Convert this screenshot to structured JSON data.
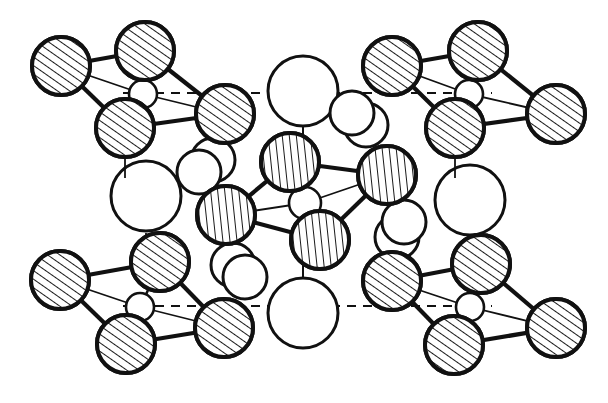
{
  "figure": {
    "caption": "",
    "background_color": "#ffffff",
    "stroke_color": "#111111",
    "hatch_color": "#1a1a1a",
    "fill_color": "#ffffff",
    "width": 608,
    "height": 403
  },
  "legend": {
    "atom_types": [
      {
        "name": "tetrahedral-anion-corner",
        "style": "hatched-diagonal",
        "radius": 27
      },
      {
        "name": "tetrahedral-anion-center",
        "style": "hatched-vertical",
        "radius": 27
      },
      {
        "name": "tetrahedral-cation-core",
        "style": "open-small",
        "radius": 14
      },
      {
        "name": "large-cation",
        "style": "open-large",
        "radius": 35
      },
      {
        "name": "paired-cation",
        "style": "open-medium",
        "radius": 22
      }
    ]
  },
  "guide_lines": [
    {
      "name": "upper-cell-axis",
      "x1": 123,
      "y1": 93,
      "x2": 492,
      "y2": 93,
      "dash": "9,7"
    },
    {
      "name": "lower-cell-axis",
      "x1": 123,
      "y1": 306,
      "x2": 492,
      "y2": 306,
      "dash": "9,7"
    }
  ],
  "tetrahedra": [
    {
      "name": "tetrahedron-top-left",
      "hatch": "diagonal",
      "core": {
        "cx": 143,
        "cy": 94,
        "r": 14
      },
      "vertices": [
        {
          "name": "vertex-left",
          "cx": 61,
          "cy": 66,
          "r": 29
        },
        {
          "name": "vertex-top",
          "cx": 145,
          "cy": 51,
          "r": 29
        },
        {
          "name": "vertex-right",
          "cx": 225,
          "cy": 114,
          "r": 29
        },
        {
          "name": "vertex-bottom",
          "cx": 125,
          "cy": 128,
          "r": 29
        }
      ],
      "thin_bonds": [
        [
          0,
          3
        ],
        [
          1,
          3
        ],
        [
          2,
          3
        ]
      ],
      "stub": {
        "x1": 125,
        "y1": 157,
        "x2": 125,
        "y2": 178
      }
    },
    {
      "name": "tetrahedron-top-right",
      "hatch": "diagonal",
      "core": {
        "cx": 469,
        "cy": 94,
        "r": 14
      },
      "vertices": [
        {
          "name": "vertex-left",
          "cx": 392,
          "cy": 66,
          "r": 29
        },
        {
          "name": "vertex-top",
          "cx": 478,
          "cy": 51,
          "r": 29
        },
        {
          "name": "vertex-right",
          "cx": 556,
          "cy": 114,
          "r": 29
        },
        {
          "name": "vertex-bottom",
          "cx": 455,
          "cy": 128,
          "r": 29
        }
      ],
      "thin_bonds": [
        [
          0,
          3
        ],
        [
          1,
          3
        ],
        [
          2,
          3
        ]
      ],
      "stub": {
        "x1": 455,
        "y1": 157,
        "x2": 455,
        "y2": 178
      }
    },
    {
      "name": "tetrahedron-bottom-left",
      "hatch": "diagonal",
      "core": {
        "cx": 140,
        "cy": 307,
        "r": 14
      },
      "vertices": [
        {
          "name": "vertex-left",
          "cx": 60,
          "cy": 280,
          "r": 29
        },
        {
          "name": "vertex-top",
          "cx": 160,
          "cy": 262,
          "r": 29
        },
        {
          "name": "vertex-right",
          "cx": 224,
          "cy": 328,
          "r": 29
        },
        {
          "name": "vertex-bottom",
          "cx": 126,
          "cy": 344,
          "r": 29
        }
      ],
      "thin_bonds": [
        [
          0,
          3
        ],
        [
          1,
          3
        ],
        [
          2,
          3
        ]
      ],
      "stub": {
        "x1": 146,
        "y1": 233,
        "x2": 146,
        "y2": 262
      }
    },
    {
      "name": "tetrahedron-bottom-right",
      "hatch": "diagonal",
      "core": {
        "cx": 470,
        "cy": 307,
        "r": 14
      },
      "vertices": [
        {
          "name": "vertex-left",
          "cx": 392,
          "cy": 281,
          "r": 29
        },
        {
          "name": "vertex-top",
          "cx": 481,
          "cy": 264,
          "r": 29
        },
        {
          "name": "vertex-right",
          "cx": 556,
          "cy": 328,
          "r": 29
        },
        {
          "name": "vertex-bottom",
          "cx": 454,
          "cy": 345,
          "r": 29
        }
      ],
      "thin_bonds": [
        [
          0,
          3
        ],
        [
          1,
          3
        ],
        [
          2,
          3
        ]
      ],
      "stub": {
        "x1": 472,
        "y1": 238,
        "x2": 472,
        "y2": 264
      }
    },
    {
      "name": "tetrahedron-center",
      "hatch": "vertical",
      "core": {
        "cx": 305,
        "cy": 203,
        "r": 16
      },
      "vertices": [
        {
          "name": "vertex-left",
          "cx": 226,
          "cy": 215,
          "r": 29
        },
        {
          "name": "vertex-top",
          "cx": 290,
          "cy": 162,
          "r": 29
        },
        {
          "name": "vertex-right",
          "cx": 387,
          "cy": 175,
          "r": 29
        },
        {
          "name": "vertex-bottom",
          "cx": 320,
          "cy": 240,
          "r": 29
        }
      ],
      "thin_bonds": [
        [
          0,
          3
        ],
        [
          1,
          3
        ],
        [
          2,
          3
        ]
      ],
      "stub": {
        "x1": 305,
        "y1": 187,
        "x2": 305,
        "y2": 173
      }
    }
  ],
  "large_cations": [
    {
      "name": "large-cation-top-center",
      "cx": 303,
      "cy": 91,
      "r": 35
    },
    {
      "name": "large-cation-mid-left",
      "cx": 146,
      "cy": 196,
      "r": 35
    },
    {
      "name": "large-cation-mid-right",
      "cx": 470,
      "cy": 200,
      "r": 35
    },
    {
      "name": "large-cation-bottom-center",
      "cx": 303,
      "cy": 313,
      "r": 35
    }
  ],
  "paired_cations": [
    {
      "name": "pair-upper-left",
      "front": {
        "cx": 199,
        "cy": 172,
        "r": 22
      },
      "back": {
        "cx": 213,
        "cy": 160,
        "r": 22
      }
    },
    {
      "name": "pair-upper-right",
      "front": {
        "cx": 352,
        "cy": 113,
        "r": 22
      },
      "back": {
        "cx": 366,
        "cy": 125,
        "r": 22
      }
    },
    {
      "name": "pair-lower-right",
      "front": {
        "cx": 404,
        "cy": 222,
        "r": 22
      },
      "back": {
        "cx": 397,
        "cy": 237,
        "r": 22
      }
    },
    {
      "name": "pair-lower-left",
      "front": {
        "cx": 245,
        "cy": 277,
        "r": 22
      },
      "back": {
        "cx": 233,
        "cy": 265,
        "r": 22
      }
    }
  ],
  "connectors": [
    {
      "name": "connector-top-center-down",
      "x1": 303,
      "y1": 126,
      "x2": 303,
      "y2": 146
    },
    {
      "name": "connector-mid-left-up",
      "x1": 146,
      "y1": 161,
      "x2": 146,
      "y2": 178
    },
    {
      "name": "connector-bottom-center-up",
      "x1": 303,
      "y1": 258,
      "x2": 303,
      "y2": 278
    }
  ]
}
